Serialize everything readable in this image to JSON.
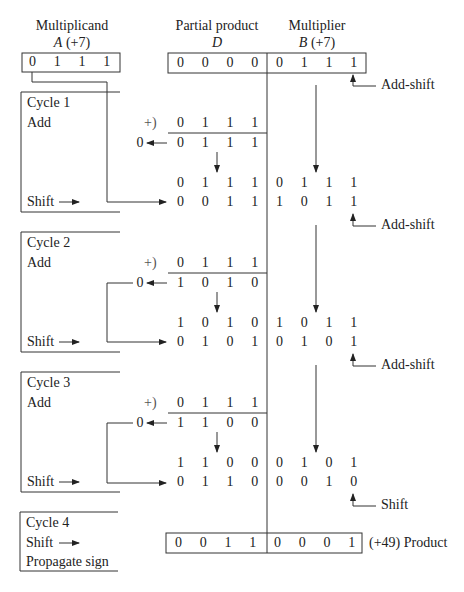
{
  "headers": {
    "multiplicand": {
      "title": "Multiplicand",
      "reg": "A",
      "value": "(+7)"
    },
    "partial_product": {
      "title": "Partial product",
      "reg": "D"
    },
    "multiplier": {
      "title": "Multiplier",
      "reg": "B",
      "value": "(+7)"
    }
  },
  "initial": {
    "A": [
      "0",
      "1",
      "1",
      "1"
    ],
    "D": [
      "0",
      "0",
      "0",
      "0"
    ],
    "B": [
      "0",
      "1",
      "1",
      "1"
    ]
  },
  "cycles": [
    {
      "label": "Cycle 1",
      "step_add": "Add",
      "step_shift": "Shift",
      "add_sign": "+)",
      "addend": [
        "0",
        "1",
        "1",
        "1"
      ],
      "carry": "0",
      "sum": [
        "0",
        "1",
        "1",
        "1"
      ],
      "before_shift": [
        "0",
        "1",
        "1",
        "1",
        "0",
        "1",
        "1",
        "1"
      ],
      "after_shift": [
        "0",
        "0",
        "1",
        "1",
        "1",
        "0",
        "1",
        "1"
      ]
    },
    {
      "label": "Cycle 2",
      "step_add": "Add",
      "step_shift": "Shift",
      "add_sign": "+)",
      "addend": [
        "0",
        "1",
        "1",
        "1"
      ],
      "carry": "0",
      "sum": [
        "1",
        "0",
        "1",
        "0"
      ],
      "before_shift": [
        "1",
        "0",
        "1",
        "0",
        "1",
        "0",
        "1",
        "1"
      ],
      "after_shift": [
        "0",
        "1",
        "0",
        "1",
        "0",
        "1",
        "0",
        "1"
      ]
    },
    {
      "label": "Cycle 3",
      "step_add": "Add",
      "step_shift": "Shift",
      "add_sign": "+)",
      "addend": [
        "0",
        "1",
        "1",
        "1"
      ],
      "carry": "0",
      "sum": [
        "1",
        "1",
        "0",
        "0"
      ],
      "before_shift": [
        "1",
        "1",
        "0",
        "0",
        "0",
        "1",
        "0",
        "1"
      ],
      "after_shift": [
        "0",
        "1",
        "1",
        "0",
        "0",
        "0",
        "1",
        "0"
      ]
    }
  ],
  "cycle4": {
    "label": "Cycle 4",
    "step_shift": "Shift",
    "step_sign": "Propagate sign"
  },
  "actions": [
    "Add-shift",
    "Add-shift",
    "Add-shift",
    "Shift"
  ],
  "product": {
    "bits": [
      "0",
      "0",
      "1",
      "1",
      "0",
      "0",
      "0",
      "1"
    ],
    "label": "(+49) Product"
  }
}
